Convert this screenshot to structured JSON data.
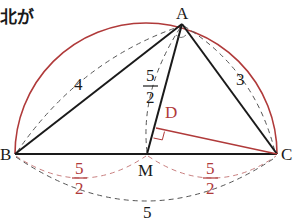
{
  "header": {
    "text": "北が"
  },
  "colors": {
    "ink": "#1a1a1a",
    "accent": "#b03a3a",
    "dash": "#555555"
  },
  "points": {
    "A": {
      "label": "A",
      "x": 182,
      "y": 24
    },
    "B": {
      "label": "B",
      "x": 15,
      "y": 154
    },
    "C": {
      "label": "C",
      "x": 277,
      "y": 154
    },
    "M": {
      "label": "M",
      "x": 147,
      "y": 154
    },
    "D": {
      "label": "D",
      "x": 157,
      "y": 128
    }
  },
  "labels": {
    "AB": "4",
    "AC": "3",
    "AM_num": "5",
    "AM_den": "2",
    "BM_num": "5",
    "BM_den": "2",
    "MC_num": "5",
    "MC_den": "2",
    "BC": "5"
  }
}
